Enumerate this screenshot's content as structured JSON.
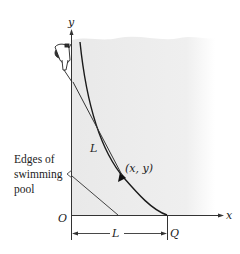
{
  "figure": {
    "axis_labels": {
      "x": "x",
      "y": "y"
    },
    "origin_label": "O",
    "point_Q_label": "Q",
    "rope_length_label": "L",
    "dimension_label": "L",
    "point_label": "(x, y)",
    "callout_lines": [
      "Edges of",
      "swimming",
      "pool"
    ],
    "colors": {
      "pool_fill": "#ebebeb",
      "line": "#333333",
      "curve": "#1a1a1a"
    }
  }
}
